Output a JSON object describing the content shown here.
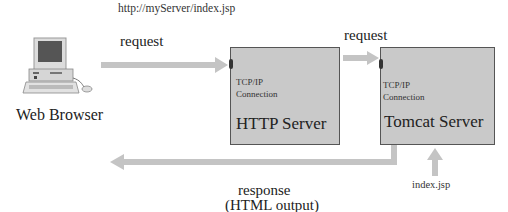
{
  "diagram": {
    "url": "http://myServer/index.jsp",
    "client": {
      "label": "Web Browser",
      "icon": "desktop-computer-icon"
    },
    "arrows": {
      "request_to_http": "request",
      "request_to_tomcat": "request",
      "response_line1": "response",
      "response_line2": "(HTML output)",
      "source_file": "index.jsp"
    },
    "http_server": {
      "connection_line1": "TCP/IP",
      "connection_line2": "Connection",
      "title": "HTTP Server"
    },
    "tomcat_server": {
      "connection_line1": "TCP/IP",
      "connection_line2": "Connection",
      "title": "Tomcat Server"
    },
    "colors": {
      "box_fill": "#c9c9c9",
      "arrow": "#c4c4c4",
      "box_border": "#555555"
    }
  }
}
